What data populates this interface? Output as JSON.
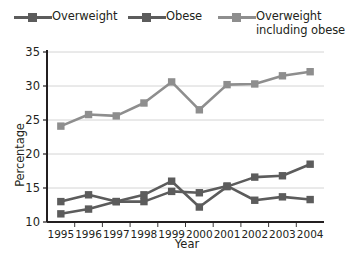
{
  "legend": {
    "position": "top",
    "entries": [
      {
        "label": "Overweight",
        "color": "#5c5c5c",
        "lines": [
          "Overweight"
        ]
      },
      {
        "label": "Obese",
        "color": "#5c5c5c",
        "lines": [
          "Obese"
        ]
      },
      {
        "label": "Overweight including obese",
        "color": "#8e8e8e",
        "lines": [
          "Overweight",
          "including obese"
        ]
      }
    ]
  },
  "axes": {
    "xlabel": "Year",
    "ylabel": "Percentage"
  },
  "chart_data": {
    "type": "line",
    "title": "",
    "xlabel": "Year",
    "ylabel": "Percentage",
    "categories": [
      "1995",
      "1996",
      "1997",
      "1998",
      "1999",
      "2000",
      "2001",
      "2002",
      "2003",
      "2004"
    ],
    "ylim": [
      10,
      35
    ],
    "yticks": [
      10,
      15,
      20,
      25,
      30,
      35
    ],
    "grid": true,
    "series": [
      {
        "name": "Overweight",
        "color": "#5c5c5c",
        "marker": "square",
        "values": [
          13.0,
          14.0,
          13.0,
          13.0,
          14.5,
          14.3,
          15.3,
          13.2,
          13.7,
          13.3
        ]
      },
      {
        "name": "Obese",
        "color": "#5c5c5c",
        "marker": "square",
        "values": [
          11.2,
          11.9,
          13.0,
          14.0,
          16.0,
          12.2,
          15.2,
          16.6,
          16.8,
          18.5
        ]
      },
      {
        "name": "Overweight including obese",
        "color": "#8e8e8e",
        "marker": "square",
        "values": [
          24.1,
          25.8,
          25.6,
          27.5,
          30.6,
          26.5,
          30.2,
          30.3,
          31.5,
          32.1
        ]
      }
    ]
  }
}
